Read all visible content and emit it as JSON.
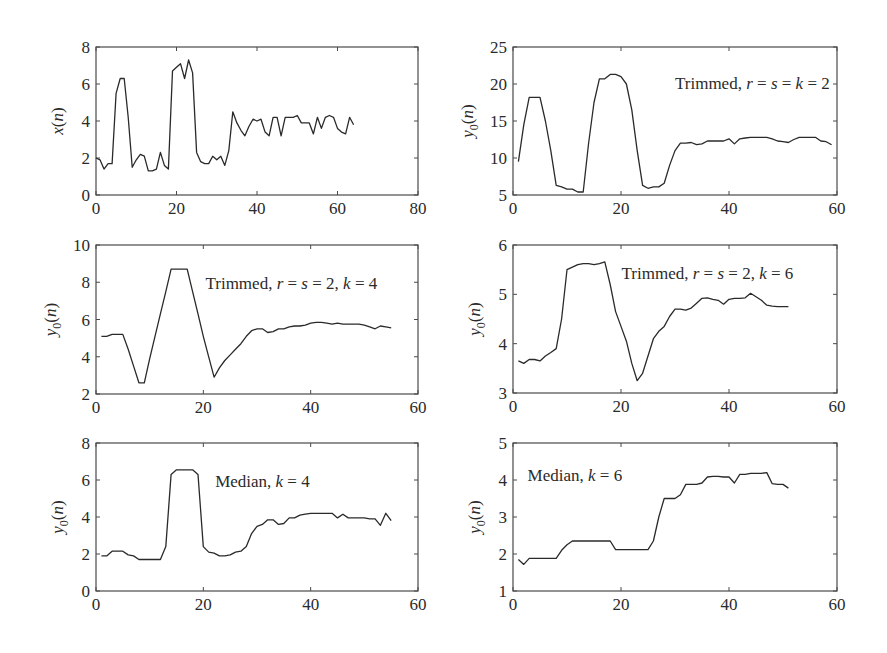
{
  "figure": {
    "background": "#ffffff",
    "line_color": "#2a2a2a",
    "axes_color": "#4a4a4a"
  },
  "chart_data": [
    {
      "id": "panel-x",
      "type": "line",
      "title": "",
      "annotation": "",
      "xlabel": "",
      "ylabel": "x(n)",
      "ylabel_base": "x",
      "ylabel_sub": "",
      "xlim": [
        0,
        80
      ],
      "ylim": [
        0,
        8
      ],
      "xticks": [
        0,
        20,
        40,
        60,
        80
      ],
      "yticks": [
        0,
        2,
        4,
        6,
        8
      ],
      "grid": false,
      "box": {
        "left": 96,
        "top": 47,
        "right": 418,
        "bottom": 195
      },
      "x": [
        0,
        1,
        2,
        3,
        4,
        5,
        6,
        7,
        8,
        9,
        10,
        11,
        12,
        13,
        14,
        15,
        16,
        17,
        18,
        19,
        20,
        21,
        22,
        23,
        24,
        25,
        26,
        27,
        28,
        29,
        30,
        31,
        32,
        33,
        34,
        35,
        36,
        37,
        38,
        39,
        40,
        41,
        42,
        43,
        44,
        45,
        46,
        47,
        48,
        49,
        50,
        51,
        52,
        53,
        54,
        55,
        56,
        57,
        58,
        59,
        60,
        61,
        62,
        63,
        64
      ],
      "values": [
        2.0,
        1.9,
        1.4,
        1.7,
        1.7,
        5.5,
        6.3,
        6.3,
        4.2,
        1.5,
        1.9,
        2.2,
        2.1,
        1.3,
        1.3,
        1.4,
        2.3,
        1.6,
        1.4,
        6.7,
        6.9,
        7.1,
        6.3,
        7.3,
        6.6,
        2.3,
        1.8,
        1.7,
        1.7,
        2.1,
        1.9,
        2.1,
        1.6,
        2.4,
        4.5,
        3.9,
        3.5,
        3.2,
        3.7,
        4.1,
        4.0,
        4.1,
        3.4,
        3.2,
        4.2,
        4.2,
        3.2,
        4.2,
        4.2,
        4.2,
        4.3,
        3.9,
        3.9,
        3.9,
        3.3,
        4.2,
        3.6,
        4.2,
        4.3,
        4.2,
        3.6,
        3.4,
        3.3,
        4.2,
        3.8
      ]
    },
    {
      "id": "panel-trim-k2",
      "type": "line",
      "title": "",
      "annotation": "Trimmed, r = s = k = 2",
      "annotation_parts": {
        "prefix": "Trimmed, ",
        "math": "r = s = k = 2"
      },
      "xlabel": "",
      "ylabel": "y0(n)",
      "ylabel_base": "y",
      "ylabel_sub": "0",
      "xlim": [
        0,
        60
      ],
      "ylim": [
        5,
        25
      ],
      "xticks": [
        0,
        20,
        40,
        60
      ],
      "yticks": [
        5,
        10,
        15,
        20,
        25
      ],
      "grid": false,
      "box": {
        "left": 513,
        "top": 47,
        "right": 837,
        "bottom": 195
      },
      "x": [
        1,
        2,
        3,
        4,
        5,
        6,
        7,
        8,
        9,
        10,
        11,
        12,
        13,
        14,
        15,
        16,
        17,
        18,
        19,
        20,
        21,
        22,
        23,
        24,
        25,
        26,
        27,
        28,
        29,
        30,
        31,
        32,
        33,
        34,
        35,
        36,
        37,
        38,
        39,
        40,
        41,
        42,
        43,
        44,
        45,
        46,
        47,
        48,
        49,
        50,
        51,
        52,
        53,
        54,
        55,
        56,
        57,
        58,
        59
      ],
      "values": [
        9.5,
        14.5,
        18.2,
        18.2,
        18.2,
        15.0,
        11.0,
        6.3,
        6.1,
        5.8,
        5.8,
        5.4,
        5.4,
        12.0,
        17.5,
        20.7,
        20.7,
        21.3,
        21.3,
        21.0,
        20.0,
        16.5,
        11.0,
        6.3,
        5.9,
        6.1,
        6.1,
        6.6,
        9.0,
        11.0,
        12.0,
        12.0,
        12.1,
        11.8,
        11.9,
        12.3,
        12.3,
        12.3,
        12.3,
        12.6,
        11.9,
        12.6,
        12.7,
        12.8,
        12.8,
        12.8,
        12.8,
        12.6,
        12.3,
        12.2,
        12.1,
        12.5,
        12.8,
        12.8,
        12.8,
        12.8,
        12.3,
        12.2,
        11.8
      ]
    },
    {
      "id": "panel-trim-k4",
      "type": "line",
      "title": "",
      "annotation": "Trimmed, r = s = 2, k = 4",
      "annotation_parts": {
        "prefix": "Trimmed, ",
        "math": "r = s = 2, k = 4"
      },
      "xlabel": "",
      "ylabel": "y0(n)",
      "ylabel_base": "y",
      "ylabel_sub": "0",
      "xlim": [
        0,
        60
      ],
      "ylim": [
        2,
        10
      ],
      "xticks": [
        0,
        20,
        40,
        60
      ],
      "yticks": [
        2,
        4,
        6,
        8,
        10
      ],
      "grid": false,
      "box": {
        "left": 96,
        "top": 245,
        "right": 418,
        "bottom": 394
      },
      "x": [
        1,
        2,
        3,
        4,
        5,
        6,
        7,
        8,
        9,
        10,
        11,
        12,
        13,
        14,
        15,
        16,
        17,
        18,
        19,
        20,
        21,
        22,
        23,
        24,
        25,
        26,
        27,
        28,
        29,
        30,
        31,
        32,
        33,
        34,
        35,
        36,
        37,
        38,
        39,
        40,
        41,
        42,
        43,
        44,
        45,
        46,
        47,
        48,
        49,
        50,
        51,
        52,
        53,
        54,
        55
      ],
      "values": [
        5.1,
        5.1,
        5.2,
        5.2,
        5.2,
        4.4,
        3.5,
        2.6,
        2.6,
        3.9,
        5.1,
        6.3,
        7.5,
        8.7,
        8.7,
        8.7,
        8.7,
        7.5,
        6.3,
        5.1,
        4.0,
        2.9,
        3.4,
        3.8,
        4.1,
        4.4,
        4.7,
        5.1,
        5.4,
        5.5,
        5.5,
        5.3,
        5.35,
        5.5,
        5.5,
        5.6,
        5.65,
        5.65,
        5.7,
        5.8,
        5.85,
        5.85,
        5.8,
        5.75,
        5.8,
        5.75,
        5.75,
        5.75,
        5.75,
        5.7,
        5.6,
        5.5,
        5.65,
        5.6,
        5.55
      ]
    },
    {
      "id": "panel-trim-k6",
      "type": "line",
      "title": "",
      "annotation": "Trimmed, r = s = 2, k = 6",
      "annotation_parts": {
        "prefix": "Trimmed, ",
        "math": "r = s = 2, k = 6"
      },
      "xlabel": "",
      "ylabel": "y0(n)",
      "ylabel_base": "y",
      "ylabel_sub": "0",
      "xlim": [
        0,
        60
      ],
      "ylim": [
        3,
        6
      ],
      "xticks": [
        0,
        20,
        40,
        60
      ],
      "yticks": [
        3,
        4,
        5,
        6
      ],
      "grid": false,
      "box": {
        "left": 513,
        "top": 245,
        "right": 837,
        "bottom": 393
      },
      "x": [
        1,
        2,
        3,
        4,
        5,
        6,
        7,
        8,
        9,
        10,
        11,
        12,
        13,
        14,
        15,
        16,
        17,
        18,
        19,
        20,
        21,
        22,
        23,
        24,
        25,
        26,
        27,
        28,
        29,
        30,
        31,
        32,
        33,
        34,
        35,
        36,
        37,
        38,
        39,
        40,
        41,
        42,
        43,
        44,
        45,
        46,
        47,
        48,
        49,
        50,
        51
      ],
      "values": [
        3.65,
        3.6,
        3.68,
        3.68,
        3.65,
        3.75,
        3.82,
        3.9,
        4.5,
        5.5,
        5.55,
        5.6,
        5.62,
        5.62,
        5.6,
        5.62,
        5.66,
        5.2,
        4.65,
        4.35,
        4.05,
        3.6,
        3.25,
        3.4,
        3.75,
        4.1,
        4.25,
        4.35,
        4.55,
        4.7,
        4.7,
        4.68,
        4.72,
        4.82,
        4.92,
        4.93,
        4.9,
        4.88,
        4.8,
        4.9,
        4.92,
        4.92,
        4.93,
        5.02,
        4.95,
        4.88,
        4.78,
        4.76,
        4.75,
        4.75,
        4.75
      ]
    },
    {
      "id": "panel-median-k4",
      "type": "line",
      "title": "",
      "annotation": "Median, k = 4",
      "annotation_parts": {
        "prefix": "Median, ",
        "math": "k = 4"
      },
      "xlabel": "",
      "ylabel": "y0(n)",
      "ylabel_base": "y",
      "ylabel_sub": "0",
      "xlim": [
        0,
        60
      ],
      "ylim": [
        0,
        8
      ],
      "xticks": [
        0,
        20,
        40,
        60
      ],
      "yticks": [
        0,
        2,
        4,
        6,
        8
      ],
      "grid": false,
      "box": {
        "left": 96,
        "top": 443,
        "right": 418,
        "bottom": 591
      },
      "x": [
        1,
        2,
        3,
        4,
        5,
        6,
        7,
        8,
        9,
        10,
        11,
        12,
        13,
        14,
        15,
        16,
        17,
        18,
        19,
        20,
        21,
        22,
        23,
        24,
        25,
        26,
        27,
        28,
        29,
        30,
        31,
        32,
        33,
        34,
        35,
        36,
        37,
        38,
        39,
        40,
        41,
        42,
        43,
        44,
        45,
        46,
        47,
        48,
        49,
        50,
        51,
        52,
        53,
        54,
        55
      ],
      "values": [
        1.9,
        1.9,
        2.15,
        2.15,
        2.15,
        1.95,
        1.9,
        1.7,
        1.7,
        1.7,
        1.7,
        1.7,
        2.4,
        6.3,
        6.55,
        6.55,
        6.55,
        6.55,
        6.3,
        2.4,
        2.1,
        2.05,
        1.9,
        1.9,
        1.95,
        2.1,
        2.15,
        2.4,
        3.1,
        3.5,
        3.6,
        3.85,
        3.85,
        3.6,
        3.65,
        3.95,
        3.95,
        4.1,
        4.15,
        4.2,
        4.2,
        4.2,
        4.2,
        4.2,
        3.95,
        4.15,
        3.95,
        3.95,
        3.95,
        3.95,
        3.9,
        3.9,
        3.55,
        4.2,
        3.8
      ]
    },
    {
      "id": "panel-median-k6",
      "type": "line",
      "title": "",
      "annotation": "Median, k = 6",
      "annotation_parts": {
        "prefix": "Median, ",
        "math": "k = 6"
      },
      "xlabel": "",
      "ylabel": "y0(n)",
      "ylabel_base": "y",
      "ylabel_sub": "0",
      "xlim": [
        0,
        60
      ],
      "ylim": [
        1,
        5
      ],
      "xticks": [
        0,
        20,
        40,
        60
      ],
      "yticks": [
        1,
        2,
        3,
        4,
        5
      ],
      "grid": false,
      "box": {
        "left": 513,
        "top": 443,
        "right": 837,
        "bottom": 591
      },
      "x": [
        1,
        2,
        3,
        4,
        5,
        6,
        7,
        8,
        9,
        10,
        11,
        12,
        13,
        14,
        15,
        16,
        17,
        18,
        19,
        20,
        21,
        22,
        23,
        24,
        25,
        26,
        27,
        28,
        29,
        30,
        31,
        32,
        33,
        34,
        35,
        36,
        37,
        38,
        39,
        40,
        41,
        42,
        43,
        44,
        45,
        46,
        47,
        48,
        49,
        50,
        51
      ],
      "values": [
        1.85,
        1.72,
        1.88,
        1.88,
        1.88,
        1.88,
        1.88,
        1.88,
        2.1,
        2.25,
        2.35,
        2.35,
        2.35,
        2.35,
        2.35,
        2.35,
        2.35,
        2.35,
        2.12,
        2.12,
        2.12,
        2.12,
        2.12,
        2.12,
        2.12,
        2.35,
        3.0,
        3.5,
        3.5,
        3.5,
        3.6,
        3.88,
        3.88,
        3.88,
        3.92,
        4.08,
        4.1,
        4.1,
        4.08,
        4.08,
        3.92,
        4.15,
        4.15,
        4.18,
        4.18,
        4.18,
        4.2,
        3.9,
        3.88,
        3.88,
        3.78
      ]
    }
  ]
}
